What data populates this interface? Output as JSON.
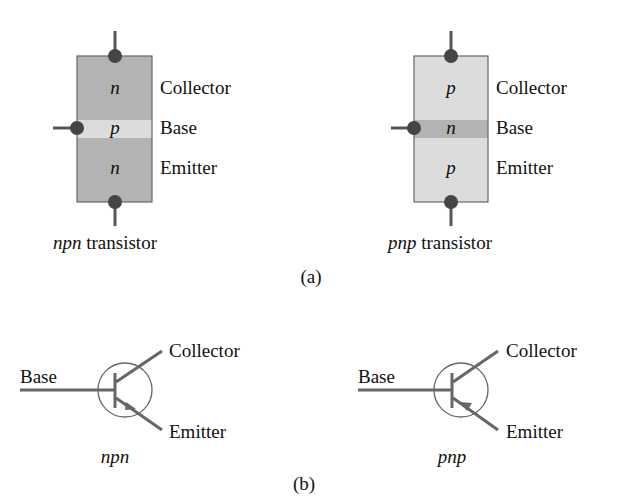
{
  "figure": {
    "part_a_label": "(a)",
    "part_b_label": "(b)",
    "colors": {
      "npn_n_region": "#b3b3b3",
      "npn_p_region": "#dcdcdc",
      "pnp_p_region": "#dcdcdc",
      "pnp_n_region": "#b3b3b3",
      "terminal_dot": "#454545",
      "lead": "#555555",
      "symbol_stroke": "#666666",
      "block_border": "#666666"
    }
  },
  "npn_block": {
    "caption_italic": "npn",
    "caption_rest": " transistor",
    "regions": [
      {
        "letter": "n",
        "label": "Collector"
      },
      {
        "letter": "p",
        "label": "Base"
      },
      {
        "letter": "n",
        "label": "Emitter"
      }
    ]
  },
  "pnp_block": {
    "caption_italic": "pnp",
    "caption_rest": " transistor",
    "regions": [
      {
        "letter": "p",
        "label": "Collector"
      },
      {
        "letter": "n",
        "label": "Base"
      },
      {
        "letter": "p",
        "label": "Emitter"
      }
    ]
  },
  "npn_symbol": {
    "caption": "npn",
    "base_label": "Base",
    "collector_label": "Collector",
    "emitter_label": "Emitter",
    "arrow_direction": "outward"
  },
  "pnp_symbol": {
    "caption": "pnp",
    "base_label": "Base",
    "collector_label": "Collector",
    "emitter_label": "Emitter",
    "arrow_direction": "inward"
  }
}
